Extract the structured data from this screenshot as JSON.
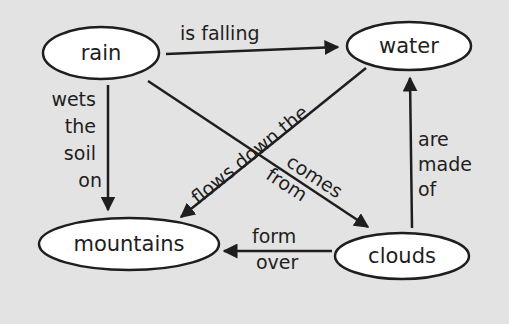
{
  "diagram": {
    "type": "concept-map",
    "background": "#e3e3e3",
    "line_color": "#1e1e1e",
    "nodes": [
      {
        "id": "rain",
        "label": "rain"
      },
      {
        "id": "water",
        "label": "water"
      },
      {
        "id": "mountains",
        "label": "mountains"
      },
      {
        "id": "clouds",
        "label": "clouds"
      }
    ],
    "links": [
      {
        "from": "rain",
        "to": "water",
        "label": "is falling"
      },
      {
        "from": "rain",
        "to": "mountains",
        "label_lines": [
          "wets",
          "the",
          "soil",
          "on"
        ]
      },
      {
        "from": "rain",
        "to": "clouds",
        "label_lines": [
          "comes",
          "from"
        ]
      },
      {
        "from": "water",
        "to": "mountains",
        "label": "flows down the"
      },
      {
        "from": "clouds",
        "to": "water",
        "label_lines": [
          "are",
          "made",
          "of"
        ]
      },
      {
        "from": "clouds",
        "to": "mountains",
        "label_lines": [
          "form",
          "over"
        ]
      }
    ]
  }
}
